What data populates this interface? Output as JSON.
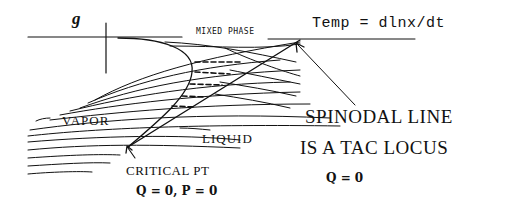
{
  "diagram": {
    "axis_label": "g",
    "mixed_phase_label": "MIXED PHASE",
    "temp_label": "Temp = dlnx/dt",
    "vapor_label": "VAPOR",
    "liquid_label": "LIQUID",
    "critical_point": {
      "label": "CRITICAL PT",
      "equation": "Q = 0, P = 0"
    },
    "spinodal": {
      "line1": "SPINODAL LINE",
      "line2": "IS A TAC LOCUS",
      "equation": "Q = 0"
    },
    "colors": {
      "ink": "#111111",
      "background": "#ffffff"
    }
  }
}
